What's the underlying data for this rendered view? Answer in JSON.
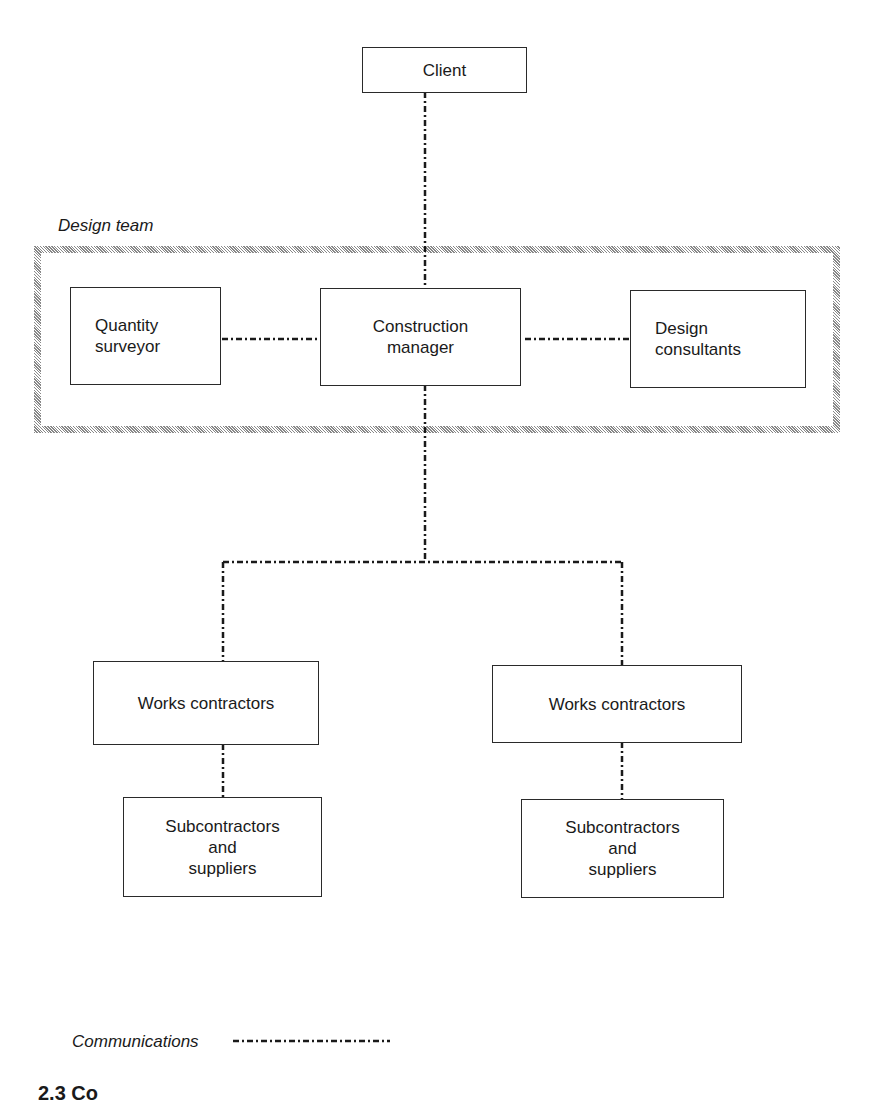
{
  "diagram": {
    "nodes": {
      "client": {
        "label": "Client"
      },
      "quantity_surveyor": {
        "label": "Quantity\nsurveyor"
      },
      "construction_manager": {
        "label": "Construction\nmanager"
      },
      "design_consultants": {
        "label": "Design\nconsultants"
      },
      "works_contractors_left": {
        "label": "Works contractors"
      },
      "works_contractors_right": {
        "label": "Works contractors"
      },
      "subcontractors_left": {
        "label": "Subcontractors\nand\nsuppliers"
      },
      "subcontractors_right": {
        "label": "Subcontractors\nand\nsuppliers"
      }
    },
    "group": {
      "label": "Design team"
    },
    "edges": [
      {
        "from": "client",
        "to": "construction_manager",
        "style": "communications"
      },
      {
        "from": "quantity_surveyor",
        "to": "construction_manager",
        "style": "communications"
      },
      {
        "from": "construction_manager",
        "to": "design_consultants",
        "style": "communications"
      },
      {
        "from": "construction_manager",
        "to": "works_contractors_left",
        "style": "communications"
      },
      {
        "from": "construction_manager",
        "to": "works_contractors_right",
        "style": "communications"
      },
      {
        "from": "works_contractors_left",
        "to": "subcontractors_left",
        "style": "communications"
      },
      {
        "from": "works_contractors_right",
        "to": "subcontractors_right",
        "style": "communications"
      }
    ],
    "legend": {
      "label": "Communications"
    },
    "caption": "2.3 Co"
  }
}
